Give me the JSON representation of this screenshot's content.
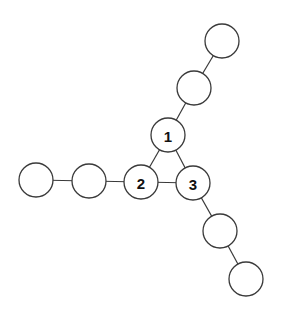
{
  "diagram": {
    "type": "graph",
    "nodes": [
      {
        "id": "t2",
        "label": "",
        "x": 222,
        "y": 41
      },
      {
        "id": "t1",
        "label": "",
        "x": 194,
        "y": 88
      },
      {
        "id": "n1",
        "label": "1",
        "x": 168,
        "y": 135
      },
      {
        "id": "l2",
        "label": "",
        "x": 36,
        "y": 180
      },
      {
        "id": "l1",
        "label": "",
        "x": 89,
        "y": 181
      },
      {
        "id": "n2",
        "label": "2",
        "x": 141,
        "y": 182
      },
      {
        "id": "n3",
        "label": "3",
        "x": 193,
        "y": 183
      },
      {
        "id": "b1",
        "label": "",
        "x": 220,
        "y": 231
      },
      {
        "id": "b2",
        "label": "",
        "x": 246,
        "y": 279
      }
    ],
    "edges": [
      [
        "t2",
        "t1"
      ],
      [
        "t1",
        "n1"
      ],
      [
        "n1",
        "n2"
      ],
      [
        "n1",
        "n3"
      ],
      [
        "n2",
        "n3"
      ],
      [
        "l2",
        "l1"
      ],
      [
        "l1",
        "n2"
      ],
      [
        "n3",
        "b1"
      ],
      [
        "b1",
        "b2"
      ]
    ],
    "node_radius": 17
  }
}
